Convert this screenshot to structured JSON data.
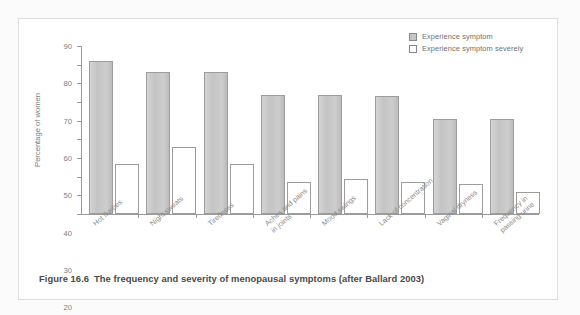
{
  "caption": {
    "number": "Figure 16.6",
    "text": "The frequency and severity of menopausal symptoms (after Ballard 2003)"
  },
  "legend": {
    "items": [
      {
        "label": "Experience symptom",
        "swatch": "filled-gray-square-icon",
        "color": "#c6c6c6"
      },
      {
        "label": "Experience symptom severely",
        "swatch": "hollow-white-square-icon",
        "color": "#ffffff"
      }
    ]
  },
  "chart_data": {
    "type": "bar",
    "title": "",
    "xlabel": "",
    "ylabel": "Percentage of women",
    "ylim": [
      0,
      90
    ],
    "yticks": [
      0,
      10,
      20,
      30,
      40,
      50,
      60,
      70,
      80,
      90
    ],
    "ytick_labels": [
      "0",
      "10",
      "20",
      "30",
      "40",
      "50",
      "60",
      "70",
      "80",
      "90"
    ],
    "grid": false,
    "legend_position": "top-right",
    "categories": [
      "Hot flushes",
      "Night sweats",
      "Tiredness",
      "Aches and pains in joints",
      "Mood swings",
      "Lack of concentration",
      "Vaginal dryness",
      "Frequency in passing urine"
    ],
    "category_lines": [
      [
        "Hot flushes"
      ],
      [
        "Night sweats"
      ],
      [
        "Tiredness"
      ],
      [
        "Aches and pains",
        "in joints"
      ],
      [
        "Mood swings"
      ],
      [
        "Lack of concentration"
      ],
      [
        "Vaginal dryness"
      ],
      [
        "Frequency in",
        "passing urine"
      ]
    ],
    "series": [
      {
        "name": "Experience symptom",
        "color": "#c6c6c6",
        "values": [
          82,
          76,
          76,
          64,
          64,
          63,
          51,
          51
        ]
      },
      {
        "name": "Experience symptom severely",
        "color": "#ffffff",
        "values": [
          27,
          36,
          27,
          17,
          19,
          17,
          16,
          12
        ]
      }
    ]
  }
}
